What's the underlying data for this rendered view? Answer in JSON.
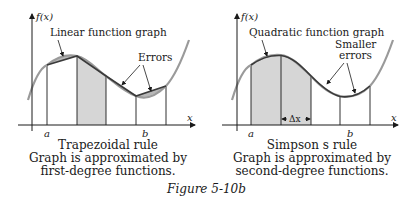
{
  "figure_label": "Figure 5-10b",
  "colors": {
    "curve": "#9a9a9a",
    "approx": "#3a3a3a",
    "shade": "#d6d6d6",
    "error_fill": "#b8b8b8",
    "axis": "#1a1a1a"
  },
  "left_panel": {
    "y_axis_label": "f(x)",
    "x_axis_label": "x",
    "a_label": "a",
    "b_label": "b",
    "annotation_approx": "Linear function graph",
    "annotation_errors": "Errors",
    "caption_title": "Trapezoidal rule",
    "caption_line1": "Graph is approximated by",
    "caption_line2": "first-degree functions."
  },
  "right_panel": {
    "y_axis_label": "f(x)",
    "x_axis_label": "x",
    "a_label": "a",
    "b_label": "b",
    "dx_label": "Δx",
    "annotation_approx": "Quadratic function graph",
    "annotation_errors_line1": "Smaller",
    "annotation_errors_line2": "errors",
    "caption_title": "Simpson s rule",
    "caption_line1": "Graph is approximated by",
    "caption_line2": "second-degree functions."
  }
}
